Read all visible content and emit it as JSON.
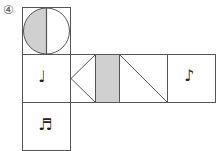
{
  "problem_label": "④",
  "net": {
    "cells": [
      {
        "id": "top",
        "content": "half-shaded-circle"
      },
      {
        "id": "left",
        "content": "quarter-note",
        "symbol": "♩"
      },
      {
        "id": "center",
        "content": "triangle-and-shaded-strip"
      },
      {
        "id": "center-right",
        "content": "diagonal-line"
      },
      {
        "id": "right",
        "content": "eighth-note",
        "symbol": "♪"
      },
      {
        "id": "bottom",
        "content": "beamed-sixteenth-notes",
        "symbol": "♬"
      }
    ],
    "colors": {
      "line": "#555555",
      "shade": "#d0d0d0"
    }
  }
}
